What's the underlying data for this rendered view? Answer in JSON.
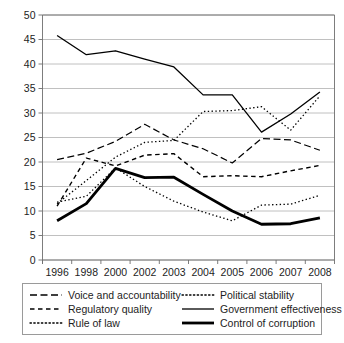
{
  "chart_data": {
    "type": "line",
    "title": "",
    "subtitle": "",
    "xlabel": "",
    "ylabel": "",
    "grid": true,
    "legend_position": "bottom",
    "ylim": [
      0,
      50
    ],
    "ytick_step": 5,
    "yticks": [
      "0",
      "5",
      "10",
      "15",
      "20",
      "25",
      "30",
      "35",
      "40",
      "45",
      "50"
    ],
    "categories": [
      "1996",
      "1998",
      "2000",
      "2002",
      "2003",
      "2004",
      "2005",
      "2006",
      "2007",
      "2008"
    ],
    "series": [
      {
        "name": "Voice and accountability",
        "style": "long-dash",
        "width": 1.2,
        "values": [
          20.5,
          21.8,
          24.2,
          27.7,
          24.5,
          22.7,
          19.8,
          24.8,
          24.5,
          22.4
        ]
      },
      {
        "name": "Regulatory quality",
        "style": "dash",
        "width": 1.4,
        "values": [
          11.0,
          20.8,
          19.2,
          21.4,
          21.7,
          17.0,
          17.2,
          17.0,
          18.2,
          19.3
        ]
      },
      {
        "name": "Rule of law",
        "style": "dot",
        "width": 1.3,
        "values": [
          11.8,
          13.0,
          18.8,
          15.0,
          12.0,
          9.8,
          8.0,
          11.2,
          11.4,
          13.2
        ]
      },
      {
        "name": "Political stability",
        "style": "dot",
        "width": 1.3,
        "values": [
          11.5,
          16.2,
          21.0,
          24.0,
          24.4,
          30.3,
          30.5,
          31.3,
          26.5,
          33.5
        ]
      },
      {
        "name": "Government effectiveness",
        "style": "solid",
        "width": 1.3,
        "values": [
          45.8,
          41.9,
          42.7,
          41.0,
          39.4,
          33.7,
          33.7,
          26.1,
          29.8,
          34.3
        ]
      },
      {
        "name": "Control of corruption",
        "style": "thick-solid",
        "width": 2.8,
        "values": [
          8.0,
          11.5,
          18.7,
          16.8,
          16.9,
          13.4,
          10.0,
          7.3,
          7.4,
          8.6
        ]
      }
    ]
  },
  "legend": {
    "entries": [
      {
        "label": "Voice and accountability",
        "style": "long-dash"
      },
      {
        "label": "Political stability",
        "style": "dot"
      },
      {
        "label": "Regulatory quality",
        "style": "dash"
      },
      {
        "label": "Government effectiveness",
        "style": "solid"
      },
      {
        "label": "Rule of law",
        "style": "dot"
      },
      {
        "label": "Control of corruption",
        "style": "thick-solid"
      }
    ]
  },
  "colors": {
    "line": "#000000",
    "grid": "#b0b0b0",
    "axis": "#6e6e6e",
    "text": "#1d1d1d",
    "background": "#ffffff"
  }
}
